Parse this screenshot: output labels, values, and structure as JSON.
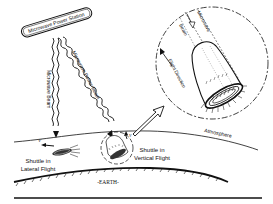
{
  "diagram": {
    "type": "illustration",
    "nodes": {
      "station": {
        "label": "Microwave Power Station"
      },
      "beam_left": {
        "label": "Microwave Beam"
      },
      "beam_right": {
        "label": "Microwave Power Beam"
      },
      "shuttle_lateral": {
        "label_line1": "Shuttle in",
        "label_line2": "Lateral Flight",
        "velocity": "V"
      },
      "shuttle_vertical": {
        "label_line1": "Shuttle in",
        "label_line2": "Vertical Flight",
        "velocity": "V"
      },
      "atmosphere": {
        "label": "Atmosphere"
      },
      "earth": {
        "label": "-EARTH-"
      },
      "inset": {
        "beam_label_1": "Microwave",
        "beam_label_2": "Beam",
        "direction_label": "Flight Direction"
      }
    },
    "colors": {
      "ink": "#111111",
      "background": "#ffffff"
    }
  }
}
